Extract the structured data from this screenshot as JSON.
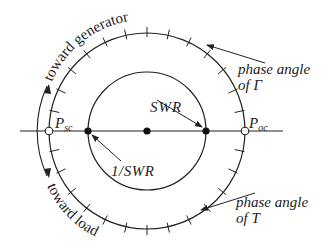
{
  "diagram": {
    "labels": {
      "toward_generator": "toward generator",
      "toward_load": "toward load",
      "phase_gamma_line1": "phase angle",
      "phase_gamma_line2": "of Γ",
      "phase_t_line1": "phase angle",
      "phase_t_line2": "of T",
      "swr": "SWR",
      "inv_swr": "1/SWR",
      "psc_main": "P",
      "psc_sub": "sc",
      "poc_main": "P",
      "poc_sub": "oc"
    },
    "colors": {
      "stroke": "#222222",
      "background": "#ffffff"
    }
  }
}
